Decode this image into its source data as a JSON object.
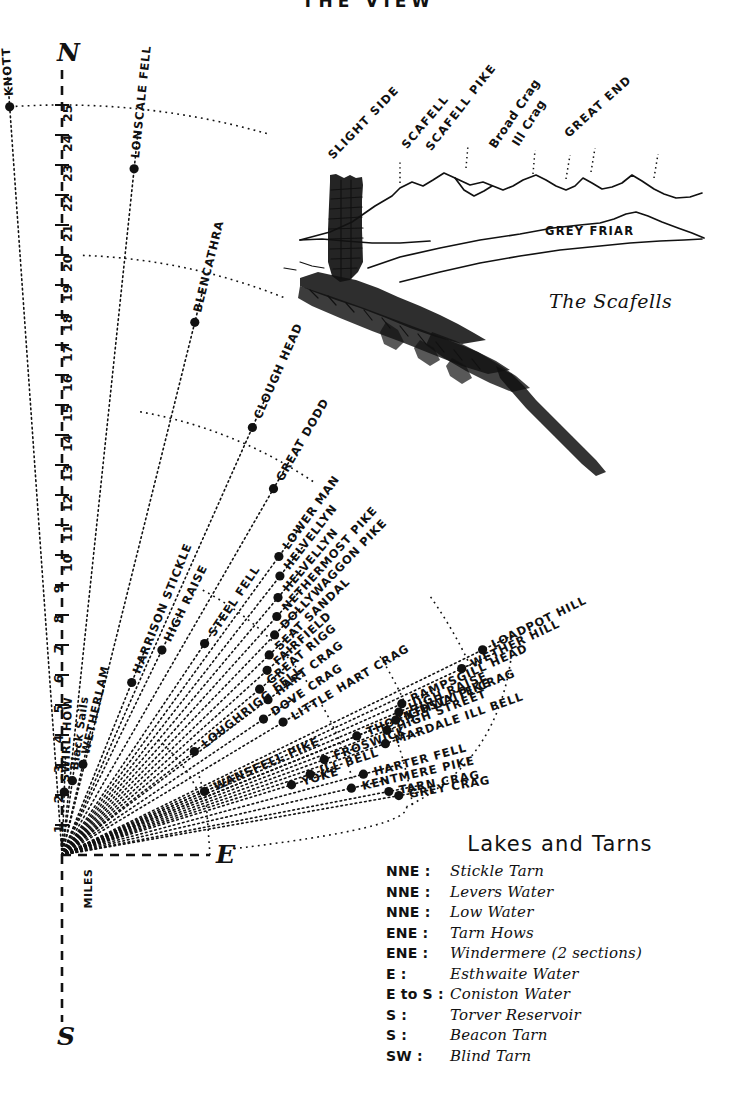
{
  "title": "THE VIEW",
  "compass": {
    "north": "N",
    "east": "E",
    "south": "S"
  },
  "scale": {
    "unit_label": "MILES",
    "ticks": [
      1,
      2,
      3,
      4,
      5,
      6,
      7,
      8,
      9,
      10,
      11,
      12,
      13,
      14,
      15,
      16,
      17,
      18,
      19,
      20,
      21,
      22,
      23,
      24,
      25
    ]
  },
  "peaks": [
    {
      "name": "KNOTT",
      "angle": -4,
      "dist": 25.0
    },
    {
      "name": "LONSCALE FELL",
      "angle": 6,
      "dist": 23.0
    },
    {
      "name": "BLENCATHRA",
      "angle": 14,
      "dist": 18.3
    },
    {
      "name": "CLOUGH HEAD",
      "angle": 24,
      "dist": 15.6
    },
    {
      "name": "GREAT DODD",
      "angle": 30,
      "dist": 14.1
    },
    {
      "name": "LOWER MAN",
      "angle": 36,
      "dist": 12.3
    },
    {
      "name": "HELVELLYN",
      "angle": 38,
      "dist": 11.8
    },
    {
      "name": "HELVELLYN",
      "angle": 40,
      "dist": 11.2
    },
    {
      "name": "NETHERMOST PIKE",
      "angle": 42,
      "dist": 10.7
    },
    {
      "name": "DOLLYWAGGON PIKE",
      "angle": 44,
      "dist": 10.2
    },
    {
      "name": "SEAT SANDAL",
      "angle": 46,
      "dist": 9.6
    },
    {
      "name": "FAIRFIELD",
      "angle": 48,
      "dist": 9.2
    },
    {
      "name": "GREAT RIGG",
      "angle": 50,
      "dist": 8.6
    },
    {
      "name": "HART CRAG",
      "angle": 53,
      "dist": 8.6
    },
    {
      "name": "DOVE CRAG",
      "angle": 56,
      "dist": 8.1
    },
    {
      "name": "STEEL FELL",
      "angle": 34,
      "dist": 8.5
    },
    {
      "name": "HIGH RAISE",
      "angle": 26,
      "dist": 7.6
    },
    {
      "name": "HARRISON STICKLE",
      "angle": 22,
      "dist": 6.2
    },
    {
      "name": "SWIRL HOW",
      "angle": 2,
      "dist": 2.1
    },
    {
      "name": "Black Sails",
      "angle": 8,
      "dist": 2.5
    },
    {
      "name": "WETHERLAM",
      "angle": 13,
      "dist": 3.1
    },
    {
      "name": "LOUGHRIGG FELL",
      "angle": 52,
      "dist": 5.6
    },
    {
      "name": "LITTLE HART CRAG",
      "angle": 59,
      "dist": 8.6
    },
    {
      "name": "LOADPOT HILL",
      "angle": 64,
      "dist": 15.6
    },
    {
      "name": "WETHER HILL",
      "angle": 65,
      "dist": 14.7
    },
    {
      "name": "RAMPSGILL HEAD",
      "angle": 66,
      "dist": 12.4
    },
    {
      "name": "HIGH RAISE",
      "angle": 67,
      "dist": 12.2
    },
    {
      "name": "KIDSTY PIKE",
      "angle": 68,
      "dist": 12.0
    },
    {
      "name": "HIGH STREET",
      "angle": 69,
      "dist": 11.6
    },
    {
      "name": "THORNTHWAITE CRAG",
      "angle": 68,
      "dist": 10.6
    },
    {
      "name": "MARDALE ILL BELL",
      "angle": 71,
      "dist": 11.4
    },
    {
      "name": "FROSWICK",
      "angle": 70,
      "dist": 9.3
    },
    {
      "name": "ILL BELL",
      "angle": 72,
      "dist": 8.7
    },
    {
      "name": "YOKE",
      "angle": 73,
      "dist": 8.0
    },
    {
      "name": "HARTER FELL",
      "angle": 75,
      "dist": 10.4
    },
    {
      "name": "KENTMERE PIKE",
      "angle": 77,
      "dist": 9.9
    },
    {
      "name": "TARN CRAG",
      "angle": 79,
      "dist": 11.1
    },
    {
      "name": "GREY CRAG",
      "angle": 80,
      "dist": 11.4
    },
    {
      "name": "WANSFELL PIKE",
      "angle": 66,
      "dist": 5.2
    }
  ],
  "scafells_sketch": {
    "caption": "The Scafells",
    "foreground_label": "GREY FRIAR",
    "summits": [
      {
        "name": "SLIGHT SIDE",
        "style": "caps"
      },
      {
        "name": "SCAFELL",
        "style": "caps"
      },
      {
        "name": "SCAFELL PIKE",
        "style": "caps"
      },
      {
        "name": "Broad Crag",
        "style": "mixed"
      },
      {
        "name": "Ill Crag",
        "style": "mixed"
      },
      {
        "name": "GREAT END",
        "style": "caps"
      }
    ]
  },
  "legend": {
    "title": "Lakes and Tarns",
    "entries": [
      {
        "direction": "NNE :",
        "name": "Stickle Tarn"
      },
      {
        "direction": "NNE :",
        "name": "Levers Water"
      },
      {
        "direction": "NNE :",
        "name": "Low Water"
      },
      {
        "direction": "ENE :",
        "name": "Tarn Hows"
      },
      {
        "direction": "ENE :",
        "name": "Windermere (2 sections)"
      },
      {
        "direction": "E :",
        "name": "Esthwaite Water"
      },
      {
        "direction": "E to S :",
        "name": "Coniston Water"
      },
      {
        "direction": "S :",
        "name": "Torver Reservoir"
      },
      {
        "direction": "S :",
        "name": "Beacon Tarn"
      },
      {
        "direction": "SW :",
        "name": "Blind Tarn"
      }
    ]
  }
}
